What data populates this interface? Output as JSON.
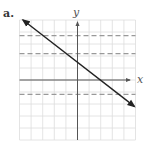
{
  "panel": {
    "label": "a."
  },
  "chart_data": {
    "type": "line",
    "title": "",
    "panel_label": "a.",
    "xlabel": "x",
    "ylabel": "y",
    "xlim": [
      -5,
      5
    ],
    "ylim": [
      -5,
      5
    ],
    "grid": true,
    "grid_step": 1,
    "tick_labels": "none",
    "series": [
      {
        "name": "line",
        "style": "solid with arrowheads at both ends",
        "equation": "y = -0.75x + 1.5",
        "slope": -0.75,
        "y_intercept": 1.5,
        "x_intercept": 2,
        "x": [
          -4.7,
          4.9
        ],
        "y": [
          5.0,
          -2.2
        ]
      }
    ],
    "dashed_horizontal_lines": [
      3.7,
      2.2,
      -1.2
    ],
    "colors": {
      "line": "#222222",
      "axes": "#555555",
      "grid": "#dddddd",
      "dashed": "#999999"
    }
  }
}
